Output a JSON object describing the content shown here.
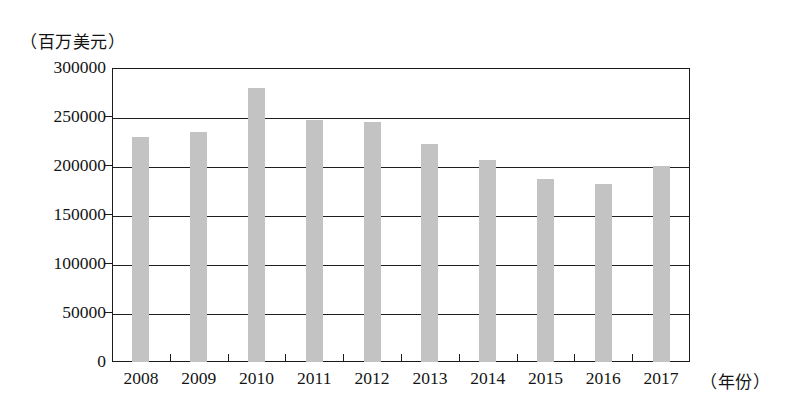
{
  "chart_data": {
    "type": "bar",
    "title": "",
    "subtitle": "",
    "xlabel": "（年份）",
    "ylabel": "（百万美元）",
    "categories": [
      "2008",
      "2009",
      "2010",
      "2011",
      "2012",
      "2013",
      "2014",
      "2015",
      "2016",
      "2017"
    ],
    "values": [
      230000,
      235000,
      280000,
      247000,
      245000,
      222000,
      206000,
      187000,
      182000,
      200000
    ],
    "ylim": [
      0,
      300000
    ],
    "y_ticks": [
      0,
      50000,
      100000,
      150000,
      200000,
      250000,
      300000
    ],
    "y_tick_labels": [
      "0",
      "50000",
      "100000",
      "150000",
      "200000",
      "250000",
      "300000"
    ],
    "grid": true,
    "grid_axis": "y",
    "legend": false,
    "legend_position": "none",
    "bar_color": "#c3c3c3",
    "axis_color": "#1b1b1b"
  },
  "axes": {
    "y_unit_caption": "（百万美元）",
    "x_unit_caption": "（年份）"
  }
}
